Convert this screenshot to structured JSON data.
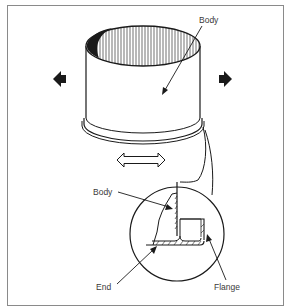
{
  "diagram": {
    "labels": {
      "body_top": "Body",
      "body_detail": "Body",
      "end": "End",
      "flange": "Flange"
    },
    "icons": {
      "left_arrow": "arrow-left-icon",
      "right_arrow": "arrow-right-icon",
      "double_arrow": "double-arrow-horizontal-icon"
    },
    "colors": {
      "line": "#1a1a1a",
      "frame": "#8a8a8a",
      "background": "#ffffff"
    }
  }
}
